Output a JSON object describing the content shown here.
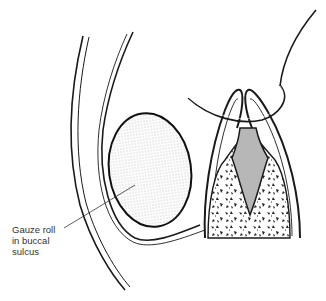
{
  "figure": {
    "type": "anatomical-illustration"
  },
  "labels": {
    "gauze_roll": {
      "line1": "Gauze roll",
      "line2": "in buccal",
      "line3": "sulcus"
    }
  },
  "colors": {
    "stroke": "#1a1a1a",
    "stipple": "#555555",
    "pulp_fill": "#c8c8c8",
    "background": "#ffffff"
  }
}
